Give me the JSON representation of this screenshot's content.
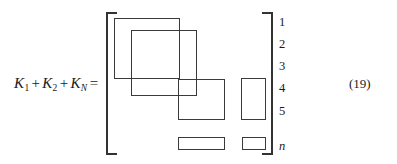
{
  "figure": {
    "kind": "matrix-equation",
    "equation_number": "(19)",
    "ink_color": "#3a3a3a",
    "background_color": "#ffffff"
  },
  "lhs": {
    "terms": [
      {
        "symbol": "K",
        "subscript": "1",
        "subscript_style": "upright"
      },
      {
        "symbol": "K",
        "subscript": "2",
        "subscript_style": "upright"
      },
      {
        "symbol": "K",
        "subscript": "N",
        "subscript_style": "italic"
      }
    ],
    "k_symbol": "K",
    "sub_1": "1",
    "sub_2": "2",
    "sub_n": "N",
    "plus": "+",
    "equals": "="
  },
  "matrix": {
    "left_bracket": "[",
    "right_bracket": "]",
    "row_labels": [
      {
        "text": "1",
        "style": "upright",
        "top": 16
      },
      {
        "text": "2",
        "style": "upright",
        "top": 38
      },
      {
        "text": "3",
        "style": "upright",
        "top": 60
      },
      {
        "text": "4",
        "style": "upright",
        "top": 82
      },
      {
        "text": "5",
        "style": "upright",
        "top": 105
      },
      {
        "text": "n",
        "style": "italic",
        "top": 140
      }
    ],
    "blocks": [
      {
        "name": "block-k1",
        "left": 114,
        "top": 18,
        "width": 66,
        "height": 61
      },
      {
        "name": "block-k2",
        "left": 131,
        "top": 30,
        "width": 66,
        "height": 66
      },
      {
        "name": "block-k3",
        "left": 178,
        "top": 79,
        "width": 47,
        "height": 41
      },
      {
        "name": "block-column-tall",
        "left": 241,
        "top": 78,
        "width": 25,
        "height": 42
      },
      {
        "name": "block-bottom-wide",
        "left": 178,
        "top": 137,
        "width": 47,
        "height": 13
      },
      {
        "name": "block-bottom-small",
        "left": 242,
        "top": 137,
        "width": 24,
        "height": 13
      }
    ]
  }
}
